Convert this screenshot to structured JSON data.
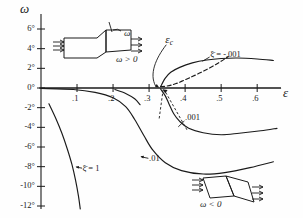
{
  "figure": {
    "background": "#fefefe",
    "ink": "#1a1a1a",
    "axis_labels": {
      "y": "ω",
      "x": "ε"
    }
  },
  "chart_data": {
    "type": "line",
    "title": "",
    "xlabel": "ε",
    "ylabel": "ω",
    "xlim": [
      -0.02,
      0.68
    ],
    "ylim": [
      -13,
      7.5
    ],
    "grid": false,
    "legend": "none",
    "xticks": [
      0.1,
      0.2,
      0.3,
      0.4,
      0.5,
      0.6
    ],
    "xtick_labels": [
      ".1",
      ".2",
      ".3",
      ".4",
      ".5",
      ".6"
    ],
    "yticks": [
      6,
      4,
      2,
      0,
      -2,
      -4,
      -6,
      -8,
      -10,
      -12
    ],
    "ytick_labels": [
      "6°",
      "4°",
      "2°",
      "0°",
      "-2°",
      "-4°",
      "-6°",
      "-8°",
      "-10°",
      "-12°"
    ],
    "annotations": [
      {
        "name": "epsilon-c",
        "text": "ε",
        "sub": "c",
        "note": "critical strain at bifurcation point",
        "x": 0.345,
        "y": 5.0
      },
      {
        "name": "xi-bar-minus-001",
        "text": "ξ̄ = -.001",
        "x": 0.47,
        "y": 3.4
      },
      {
        "name": "xi-bar-001-lower",
        "text": ".001",
        "x": 0.4,
        "y": -3.1
      },
      {
        "name": "xi-bar-01-lower",
        "text": ".01",
        "x": 0.3,
        "y": -7.2
      },
      {
        "name": "xi-bar-1",
        "text": "ξ̄ = 1",
        "x": 0.115,
        "y": -8.2
      }
    ],
    "series": [
      {
        "name": "xi-bar = -0.001 (upper branch)",
        "stroke": "#1a1a1a",
        "dash": "none",
        "points": [
          [
            0.332,
            0.15
          ],
          [
            0.345,
            1.0
          ],
          [
            0.36,
            1.6
          ],
          [
            0.385,
            2.1
          ],
          [
            0.42,
            2.55
          ],
          [
            0.46,
            2.85
          ],
          [
            0.5,
            3.0
          ],
          [
            0.545,
            3.05
          ],
          [
            0.6,
            2.95
          ],
          [
            0.645,
            2.8
          ]
        ]
      },
      {
        "name": "xi-bar = -0.001 (lower branch, dashed)",
        "stroke": "#1a1a1a",
        "dash": "dashed",
        "points": [
          [
            0.332,
            0.15
          ],
          [
            0.35,
            0.2
          ],
          [
            0.375,
            0.45
          ],
          [
            0.41,
            1.0
          ],
          [
            0.45,
            1.7
          ],
          [
            0.49,
            2.5
          ],
          [
            0.52,
            3.2
          ]
        ]
      },
      {
        "name": "trivial branch (omega = 0)",
        "stroke": "#1a1a1a",
        "dash": "none",
        "points": [
          [
            0.0,
            0.0
          ],
          [
            0.1,
            0.0
          ],
          [
            0.2,
            0.0
          ],
          [
            0.332,
            0.0
          ],
          [
            0.45,
            0.0
          ],
          [
            0.6,
            0.0
          ],
          [
            0.665,
            0.0
          ]
        ]
      },
      {
        "name": "xi-bar = 0.001 (descending branch)",
        "stroke": "#1a1a1a",
        "dash": "none",
        "points": [
          [
            0.332,
            -0.1
          ],
          [
            0.345,
            -0.8
          ],
          [
            0.355,
            -1.6
          ],
          [
            0.368,
            -2.6
          ],
          [
            0.385,
            -3.4
          ],
          [
            0.41,
            -4.1
          ],
          [
            0.45,
            -4.55
          ],
          [
            0.5,
            -4.75
          ],
          [
            0.55,
            -4.6
          ],
          [
            0.61,
            -4.35
          ],
          [
            0.655,
            -4.1
          ]
        ]
      },
      {
        "name": "xi-bar = 0.01 (descending branch)",
        "stroke": "#1a1a1a",
        "dash": "none",
        "points": [
          [
            0.0,
            -0.05
          ],
          [
            0.09,
            -0.15
          ],
          [
            0.15,
            -0.45
          ],
          [
            0.2,
            -1.0
          ],
          [
            0.235,
            -1.9
          ],
          [
            0.26,
            -3.2
          ],
          [
            0.285,
            -4.8
          ],
          [
            0.31,
            -6.3
          ],
          [
            0.345,
            -7.6
          ],
          [
            0.39,
            -8.4
          ],
          [
            0.45,
            -8.75
          ],
          [
            0.51,
            -8.6
          ],
          [
            0.58,
            -8.1
          ],
          [
            0.645,
            -7.5
          ]
        ]
      },
      {
        "name": "xi-bar = 1 (steep branch)",
        "stroke": "#1a1a1a",
        "dash": "none",
        "points": [
          [
            0.022,
            -1.6
          ],
          [
            0.04,
            -3.0
          ],
          [
            0.058,
            -4.6
          ],
          [
            0.073,
            -6.2
          ],
          [
            0.086,
            -7.8
          ],
          [
            0.096,
            -9.4
          ],
          [
            0.104,
            -11.0
          ],
          [
            0.109,
            -12.3
          ]
        ]
      },
      {
        "name": "short negative stub near origin",
        "stroke": "#1a1a1a",
        "dash": "none",
        "points": [
          [
            0.205,
            -0.15
          ],
          [
            0.235,
            -0.55
          ],
          [
            0.26,
            -1.1
          ],
          [
            0.275,
            -1.7
          ]
        ]
      }
    ]
  },
  "insets": [
    {
      "name": "inset-omega-positive",
      "label": "ω > 0",
      "tick_label": "ω",
      "description": "sheared block specimen with positive shear angle"
    },
    {
      "name": "inset-omega-negative",
      "label": "ω < 0",
      "description": "sheared block specimen with negative shear angle"
    }
  ]
}
